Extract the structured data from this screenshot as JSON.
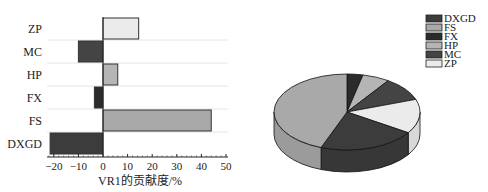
{
  "chart_data": [
    {
      "type": "bar",
      "orientation": "horizontal",
      "title": "",
      "xlabel": "VR1的贡献度/%",
      "ylabel": "",
      "categories": [
        "DXGD",
        "FS",
        "FX",
        "HP",
        "MC",
        "ZP"
      ],
      "values": [
        -21.5,
        44,
        -3.5,
        6,
        -10,
        14.5
      ],
      "colors": [
        "#3c3c3c",
        "#a9a9a9",
        "#2b2b2b",
        "#b5b5b5",
        "#444444",
        "#ebebeb"
      ],
      "xlim": [
        -23,
        50
      ],
      "xticks": [
        -20,
        -10,
        0,
        10,
        20,
        30,
        40,
        50
      ],
      "grid": true,
      "legend": null
    },
    {
      "type": "pie",
      "style": "3d",
      "title": "",
      "labels": [
        "DXGD",
        "FS",
        "FX",
        "HP",
        "MC",
        "ZP"
      ],
      "values": [
        21.5,
        44,
        3.5,
        6,
        10,
        14.5
      ],
      "colors": [
        "#3c3c3c",
        "#a9a9a9",
        "#2b2b2b",
        "#b5b5b5",
        "#444444",
        "#ebebeb"
      ],
      "legend_position": "upper right"
    }
  ],
  "bar": {
    "xlabel": "VR1的贡献度/%",
    "ticks": [
      "−20",
      "−10",
      "0",
      "10",
      "20",
      "30",
      "40",
      "50"
    ],
    "categories_top_to_bottom": [
      "ZP",
      "MC",
      "HP",
      "FX",
      "FS",
      "DXGD"
    ]
  },
  "legend": {
    "items": [
      {
        "label": "DXGD",
        "color": "#3c3c3c"
      },
      {
        "label": "FS",
        "color": "#a9a9a9"
      },
      {
        "label": "FX",
        "color": "#2b2b2b"
      },
      {
        "label": "HP",
        "color": "#b5b5b5"
      },
      {
        "label": "MC",
        "color": "#444444"
      },
      {
        "label": "ZP",
        "color": "#ebebeb"
      }
    ]
  }
}
